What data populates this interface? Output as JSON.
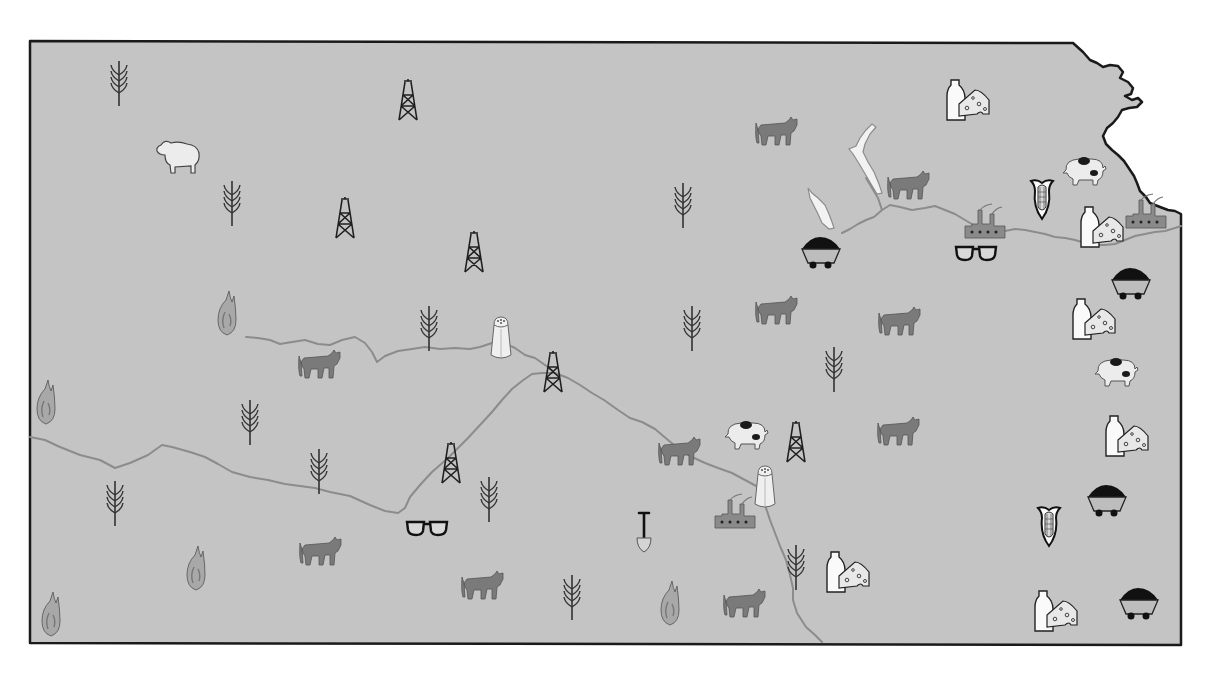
{
  "map": {
    "subject": "Kansas natural resources and products map",
    "colors": {
      "land": "#c4c4c4",
      "border": "#1a1a1a",
      "river": "#8c8c8c",
      "cattle": "#7a7a7a",
      "factory": "#8a8a8a",
      "background": "#ffffff"
    },
    "markers": [
      {
        "type": "wheat",
        "x": 119,
        "y": 83
      },
      {
        "type": "oil-derrick",
        "x": 408,
        "y": 100
      },
      {
        "type": "dairy",
        "x": 968,
        "y": 100
      },
      {
        "type": "sheep",
        "x": 177,
        "y": 157
      },
      {
        "type": "cattle",
        "x": 776,
        "y": 132
      },
      {
        "type": "wheat",
        "x": 232,
        "y": 203
      },
      {
        "type": "oil-derrick",
        "x": 345,
        "y": 218
      },
      {
        "type": "wheat",
        "x": 683,
        "y": 205
      },
      {
        "type": "cattle",
        "x": 908,
        "y": 186
      },
      {
        "type": "hog",
        "x": 1084,
        "y": 171
      },
      {
        "type": "corn",
        "x": 1042,
        "y": 198
      },
      {
        "type": "factory",
        "x": 985,
        "y": 222
      },
      {
        "type": "dairy",
        "x": 1102,
        "y": 227
      },
      {
        "type": "factory",
        "x": 1146,
        "y": 212
      },
      {
        "type": "oil-derrick",
        "x": 474,
        "y": 252
      },
      {
        "type": "coal",
        "x": 821,
        "y": 252
      },
      {
        "type": "glasses",
        "x": 976,
        "y": 253
      },
      {
        "type": "coal",
        "x": 1131,
        "y": 283
      },
      {
        "type": "natural-gas",
        "x": 227,
        "y": 313
      },
      {
        "type": "wheat",
        "x": 429,
        "y": 328
      },
      {
        "type": "salt",
        "x": 501,
        "y": 338
      },
      {
        "type": "wheat",
        "x": 692,
        "y": 328
      },
      {
        "type": "cattle",
        "x": 776,
        "y": 311
      },
      {
        "type": "cattle",
        "x": 899,
        "y": 322
      },
      {
        "type": "dairy",
        "x": 1094,
        "y": 319
      },
      {
        "type": "cattle",
        "x": 319,
        "y": 365
      },
      {
        "type": "oil-derrick",
        "x": 553,
        "y": 372
      },
      {
        "type": "wheat",
        "x": 834,
        "y": 369
      },
      {
        "type": "hog",
        "x": 1116,
        "y": 372
      },
      {
        "type": "natural-gas",
        "x": 46,
        "y": 402
      },
      {
        "type": "wheat",
        "x": 250,
        "y": 422
      },
      {
        "type": "hog",
        "x": 746,
        "y": 435
      },
      {
        "type": "oil-derrick",
        "x": 796,
        "y": 442
      },
      {
        "type": "cattle",
        "x": 898,
        "y": 432
      },
      {
        "type": "dairy",
        "x": 1127,
        "y": 436
      },
      {
        "type": "cattle",
        "x": 679,
        "y": 452
      },
      {
        "type": "oil-derrick",
        "x": 451,
        "y": 463
      },
      {
        "type": "wheat",
        "x": 319,
        "y": 471
      },
      {
        "type": "salt",
        "x": 765,
        "y": 487
      },
      {
        "type": "wheat",
        "x": 115,
        "y": 503
      },
      {
        "type": "wheat",
        "x": 489,
        "y": 499
      },
      {
        "type": "factory",
        "x": 735,
        "y": 512
      },
      {
        "type": "coal",
        "x": 1107,
        "y": 500
      },
      {
        "type": "glasses",
        "x": 427,
        "y": 528
      },
      {
        "type": "shovel",
        "x": 644,
        "y": 532
      },
      {
        "type": "corn",
        "x": 1049,
        "y": 525
      },
      {
        "type": "cattle",
        "x": 320,
        "y": 552
      },
      {
        "type": "natural-gas",
        "x": 196,
        "y": 568
      },
      {
        "type": "wheat",
        "x": 796,
        "y": 567
      },
      {
        "type": "dairy",
        "x": 848,
        "y": 572
      },
      {
        "type": "cattle",
        "x": 482,
        "y": 586
      },
      {
        "type": "wheat",
        "x": 572,
        "y": 597
      },
      {
        "type": "natural-gas",
        "x": 670,
        "y": 603
      },
      {
        "type": "cattle",
        "x": 744,
        "y": 604
      },
      {
        "type": "natural-gas",
        "x": 51,
        "y": 614
      },
      {
        "type": "dairy",
        "x": 1056,
        "y": 611
      },
      {
        "type": "coal",
        "x": 1139,
        "y": 603
      }
    ]
  }
}
